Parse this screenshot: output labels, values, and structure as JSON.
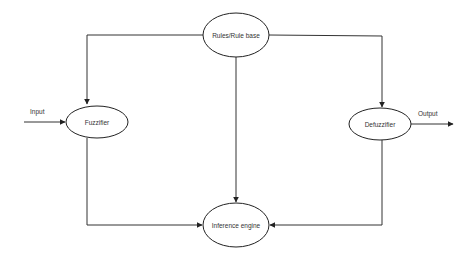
{
  "diagram": {
    "type": "flowchart",
    "title": "",
    "colors": {
      "stroke": "#222222",
      "text": "#333333",
      "background": "#ffffff"
    },
    "nodes": [
      {
        "id": "rules",
        "label": "Rules/Rule base",
        "shape": "ellipse",
        "cx": 236,
        "cy": 35,
        "rx": 33,
        "ry": 22
      },
      {
        "id": "fuzzifier",
        "label": "Fuzzifier",
        "shape": "ellipse",
        "cx": 97,
        "cy": 122,
        "rx": 31,
        "ry": 16
      },
      {
        "id": "defuzzifier",
        "label": "Defuzzifier",
        "shape": "ellipse",
        "cx": 380,
        "cy": 124,
        "rx": 31,
        "ry": 16
      },
      {
        "id": "inference",
        "label": "Inference engine",
        "shape": "ellipse",
        "cx": 236,
        "cy": 225,
        "rx": 33,
        "ry": 22
      }
    ],
    "edges": [
      {
        "from": "input",
        "to": "fuzzifier",
        "label": "Input"
      },
      {
        "from": "rules",
        "to": "fuzzifier"
      },
      {
        "from": "rules",
        "to": "inference"
      },
      {
        "from": "rules",
        "to": "defuzzifier"
      },
      {
        "from": "fuzzifier",
        "to": "inference"
      },
      {
        "from": "defuzzifier",
        "to": "inference"
      },
      {
        "from": "defuzzifier",
        "to": "output",
        "label": "Output"
      }
    ],
    "labels": {
      "input": "Input",
      "output": "Output"
    }
  }
}
